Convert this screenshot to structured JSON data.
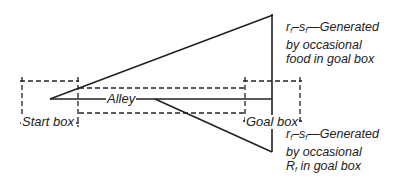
{
  "diagram": {
    "type": "runway-goal-gradient",
    "colors": {
      "line": "#222222",
      "background": "#ffffff"
    },
    "boxes": [
      {
        "id": "start-box",
        "label": "Start box"
      },
      {
        "id": "alley",
        "label": "Alley"
      },
      {
        "id": "goal-box",
        "label": "Goal box"
      }
    ],
    "gradients": [
      {
        "id": "food-gradient",
        "symbol_r": "r",
        "sub_r": "f",
        "symbol_s": "s",
        "sub_s": "f",
        "dash": "–",
        "text_line1": "—Generated",
        "text_line2": "by occasional",
        "text_line3": "food in goal box",
        "direction": "increasing"
      },
      {
        "id": "frustration-gradient",
        "symbol_r": "r",
        "sub_r": "f",
        "symbol_s": "s",
        "sub_s": "f",
        "dash": "–",
        "text_line1": "—Generated",
        "text_line2": "by occasional",
        "text_line3_prefix": "R",
        "text_line3_sub": "f",
        "text_line3": " in goal box",
        "direction": "increasing"
      }
    ]
  }
}
